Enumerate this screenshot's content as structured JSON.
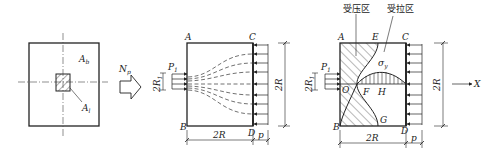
{
  "figure1": {
    "label_Ab": "A",
    "label_Ab_sub": "b",
    "label_Al": "A",
    "label_Al_sub": "l"
  },
  "load_arrow": {
    "label": "N",
    "label_sub": "p"
  },
  "figure2": {
    "corner_A": "A",
    "corner_B": "B",
    "corner_C": "C",
    "corner_D": "D",
    "load_label": "P",
    "load_sub": "1",
    "width_2R1": "2R",
    "width_2R1_sub": "1",
    "height_dim": "2R",
    "bottom_dim": "2R",
    "pressure_dim": "p"
  },
  "figure3": {
    "zone_compression": "受压区",
    "zone_tension": "受拉区",
    "corner_A": "A",
    "corner_B": "B",
    "corner_C": "C",
    "corner_D": "D",
    "point_E": "E",
    "point_F": "F",
    "point_G": "G",
    "point_H": "H",
    "point_O": "O",
    "stress_label": "σ",
    "stress_sub": "y",
    "load_label": "P",
    "load_sub": "1",
    "width_2R1": "2R",
    "width_2R1_sub": "1",
    "height_dim": "2R",
    "bottom_dim": "2R",
    "pressure_dim": "p",
    "axis_label": "X"
  }
}
